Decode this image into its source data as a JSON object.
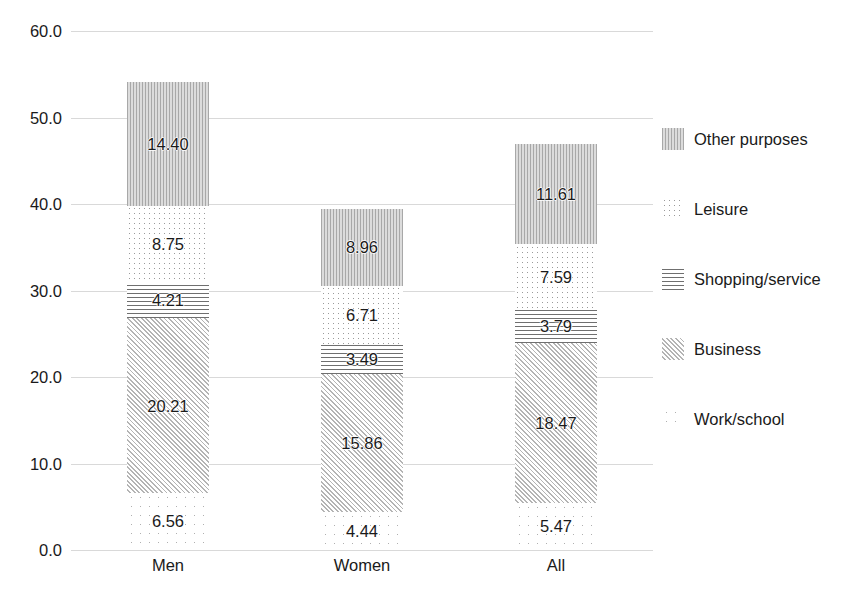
{
  "chart_data": {
    "type": "bar",
    "stacked": true,
    "title": "",
    "xlabel": "",
    "ylabel": "",
    "categories": [
      "Men",
      "Women",
      "All"
    ],
    "ylim": [
      0.0,
      60.0
    ],
    "ytick_labels": [
      "0.0",
      "10.0",
      "20.0",
      "30.0",
      "40.0",
      "50.0",
      "60.0"
    ],
    "ytick_values": [
      0,
      10,
      20,
      30,
      40,
      50,
      60
    ],
    "grid": true,
    "legend_position": "right",
    "series": [
      {
        "name": "Work/school",
        "pattern": "dots-sparse",
        "values": [
          6.56,
          4.44,
          5.47
        ],
        "labels": [
          "6.56",
          "4.44",
          "5.47"
        ]
      },
      {
        "name": "Business",
        "pattern": "diagonal",
        "values": [
          20.21,
          15.86,
          18.47
        ],
        "labels": [
          "20.21",
          "15.86",
          "18.47"
        ]
      },
      {
        "name": "Shopping/service",
        "pattern": "horizontal",
        "values": [
          4.21,
          3.49,
          3.79
        ],
        "labels": [
          "4.21",
          "3.49",
          "3.79"
        ]
      },
      {
        "name": "Leisure",
        "pattern": "dots-fine",
        "values": [
          8.75,
          6.71,
          7.59
        ],
        "labels": [
          "8.75",
          "6.71",
          "7.59"
        ]
      },
      {
        "name": "Other purposes",
        "pattern": "vertical",
        "values": [
          14.4,
          8.96,
          11.61
        ],
        "labels": [
          "14.40",
          "8.96",
          "11.61"
        ]
      }
    ],
    "totals": [
      54.13,
      39.46,
      46.93
    ],
    "legend_order": [
      "Other purposes",
      "Leisure",
      "Shopping/service",
      "Business",
      "Work/school"
    ],
    "colors": {
      "gridline": "#d9d9d9",
      "text": "#1a1a1a",
      "pattern_ink": "#9a9a9a"
    }
  }
}
